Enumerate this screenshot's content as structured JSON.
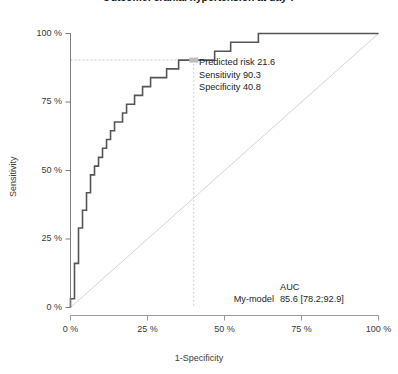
{
  "title": "Outcome: cranial hypertension at day 7",
  "chart_data": {
    "type": "line",
    "title": "Outcome: cranial hypertension at day 7",
    "xlabel": "1-Specificity",
    "ylabel": "Sensitivity",
    "xlim": [
      0,
      100
    ],
    "ylim": [
      0,
      100
    ],
    "grid": false,
    "legend_position": "bottom-right",
    "x_ticks": [
      "0 %",
      "25 %",
      "50 %",
      "75 %",
      "100 %"
    ],
    "x_tick_values": [
      0,
      25,
      50,
      75,
      100
    ],
    "y_ticks": [
      "0 %",
      "25 %",
      "50 %",
      "75 %",
      "100 %"
    ],
    "y_tick_values": [
      0,
      25,
      50,
      75,
      100
    ],
    "series": [
      {
        "name": "My-model",
        "type": "roc-step",
        "color": "#555555",
        "points": [
          [
            0.0,
            0.0
          ],
          [
            0.0,
            3.2
          ],
          [
            1.3,
            3.2
          ],
          [
            1.3,
            16.1
          ],
          [
            2.6,
            16.1
          ],
          [
            2.6,
            22.6
          ],
          [
            2.6,
            29.0
          ],
          [
            3.9,
            29.0
          ],
          [
            3.9,
            35.5
          ],
          [
            5.2,
            35.5
          ],
          [
            5.2,
            41.9
          ],
          [
            6.5,
            41.9
          ],
          [
            6.5,
            48.4
          ],
          [
            7.8,
            48.4
          ],
          [
            7.8,
            51.6
          ],
          [
            9.1,
            51.6
          ],
          [
            9.1,
            54.8
          ],
          [
            10.4,
            54.8
          ],
          [
            10.4,
            58.1
          ],
          [
            11.7,
            58.1
          ],
          [
            11.7,
            61.3
          ],
          [
            13.0,
            61.3
          ],
          [
            13.0,
            64.5
          ],
          [
            14.3,
            64.5
          ],
          [
            14.3,
            67.7
          ],
          [
            16.9,
            67.7
          ],
          [
            16.9,
            71.0
          ],
          [
            18.2,
            71.0
          ],
          [
            18.2,
            74.2
          ],
          [
            20.8,
            74.2
          ],
          [
            20.8,
            77.4
          ],
          [
            23.4,
            77.4
          ],
          [
            23.4,
            80.6
          ],
          [
            26.0,
            80.6
          ],
          [
            26.0,
            83.9
          ],
          [
            31.2,
            83.9
          ],
          [
            31.2,
            87.1
          ],
          [
            35.1,
            87.1
          ],
          [
            35.1,
            90.3
          ],
          [
            40.0,
            90.3
          ],
          [
            46.8,
            90.3
          ],
          [
            46.8,
            93.5
          ],
          [
            52.0,
            93.5
          ],
          [
            52.0,
            96.8
          ],
          [
            61.0,
            96.8
          ],
          [
            61.0,
            100.0
          ],
          [
            100.0,
            100.0
          ]
        ]
      },
      {
        "name": "reference-diagonal",
        "type": "line",
        "color": "#d4d4d4",
        "points": [
          [
            0,
            0
          ],
          [
            100,
            100
          ]
        ]
      }
    ],
    "marker": {
      "x": 40.0,
      "y": 90.3,
      "color": "#bdbdbd",
      "guide_color": "#c8c8c8"
    },
    "annotations": {
      "predicted_risk": "Predicted risk 21.6",
      "sensitivity": "Sensitivity 90.3",
      "specificity": "Specificity 40.8"
    },
    "legend": {
      "header": "AUC",
      "model_label": "My-model",
      "auc_value": "85.6 [78.2;92.9]"
    }
  },
  "axis": {
    "x_title": "1-Specificity",
    "y_title": "Sensitivity"
  }
}
